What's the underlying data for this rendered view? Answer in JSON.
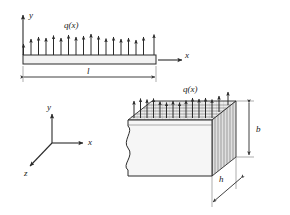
{
  "figure": {
    "background_color": "#ffffff",
    "line_color": "#2b2b2b",
    "fill_light": "#f2f2f2",
    "fill_mid": "#e3e3e3",
    "fill_dark": "#d2d2d2"
  },
  "side_view": {
    "name": "beam-side-view",
    "load_label": "q(x)",
    "axis_y_label": "y",
    "axis_x_label": "x",
    "length_label": "l",
    "arrow_count": 18,
    "beam": {
      "x_left": 23,
      "x_right": 156,
      "y_top": 55,
      "y_bottom": 64
    },
    "arrows": {
      "base_y": 55,
      "tip_y_min": 33,
      "tip_y_max": 44,
      "tip_heights": [
        44,
        39,
        37,
        38,
        36,
        38,
        35,
        37,
        36,
        34,
        36,
        38,
        37,
        39,
        38,
        40,
        37,
        35
      ]
    },
    "dimension_line": {
      "y": 77,
      "x_left": 23,
      "x_right": 156
    }
  },
  "axes_triad": {
    "name": "coordinate-axes",
    "origin": {
      "x": 52,
      "y": 143
    },
    "y_label": "y",
    "x_label": "x",
    "z_label": "z",
    "y_tip": {
      "x": 52,
      "y": 112
    },
    "x_tip": {
      "x": 85,
      "y": 143
    },
    "z_tip": {
      "x": 28,
      "y": 168
    }
  },
  "solid_view": {
    "name": "beam-3d-view",
    "load_label": "q(x)",
    "height_label": "b",
    "thickness_label": "h",
    "arrow_count": 15,
    "top_face_front_left": {
      "x": 128,
      "y": 120
    },
    "top_face_front_right": {
      "x": 212,
      "y": 120
    },
    "top_face_back_right": {
      "x": 236,
      "y": 101
    },
    "top_face_back_left": {
      "x": 152,
      "y": 101
    },
    "front_bottom_left": {
      "x": 128,
      "y": 176
    },
    "front_bottom_right": {
      "x": 212,
      "y": 176
    },
    "right_bottom_back": {
      "x": 236,
      "y": 157
    },
    "b_dimension": {
      "x": 249,
      "y_top": 102,
      "y_bottom": 172
    },
    "h_dimension": {
      "x1": 213,
      "y1": 201,
      "x2": 239,
      "y2": 181
    }
  }
}
